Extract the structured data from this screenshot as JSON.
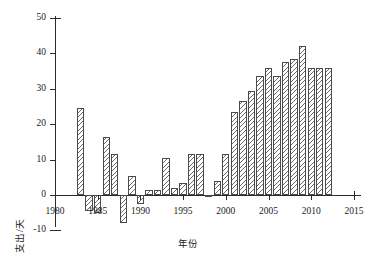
{
  "chart_data": {
    "type": "bar",
    "title": "",
    "subtitle": "",
    "xlabel": "年份",
    "ylabel": "支出/天",
    "xlim": [
      1980,
      2015
    ],
    "ylim": [
      -10,
      50
    ],
    "grid": false,
    "legend": "none",
    "xticks": [
      "1980",
      "1985",
      "1990",
      "1995",
      "2000",
      "2005",
      "2010",
      "2015"
    ],
    "xtick_values": [
      1980,
      1985,
      1990,
      1995,
      2000,
      2005,
      2010,
      2015
    ],
    "yticks": [
      "-10",
      "0",
      "10",
      "20",
      "30",
      "40",
      "50"
    ],
    "ytick_values": [
      -10,
      0,
      10,
      20,
      30,
      40,
      50
    ],
    "categories": [
      1983,
      1984,
      1985,
      1986,
      1987,
      1988,
      1989,
      1990,
      1991,
      1992,
      1993,
      1994,
      1995,
      1996,
      1997,
      1998,
      1999,
      2000,
      2001,
      2002,
      2003,
      2004,
      2005,
      2006,
      2007,
      2008,
      2009,
      2010,
      2011,
      2012
    ],
    "values": [
      24.5,
      -4.5,
      -5.0,
      16.5,
      11.5,
      -8.0,
      5.5,
      -2.5,
      1.5,
      1.5,
      10.5,
      2.0,
      3.5,
      11.5,
      11.5,
      -0.5,
      4.0,
      11.5,
      23.5,
      26.5,
      29.5,
      33.5,
      36.0,
      33.5,
      37.5,
      38.5,
      42.0,
      36.0,
      36.0,
      36.0
    ],
    "bar_fill": "white",
    "bar_hatch": "///",
    "bar_edge_color": "#4a4a4a"
  },
  "axes": {
    "y_axis_label": "支出/天",
    "x_axis_label": "年份"
  }
}
